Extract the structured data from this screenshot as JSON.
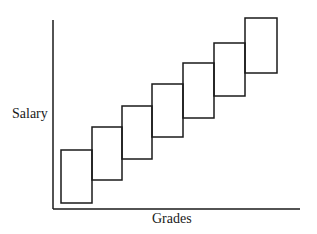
{
  "diagram": {
    "ylabel": "Salary",
    "xlabel": "Grades",
    "line_color": "#1a1a1a",
    "boxes": [
      {
        "grade": 1,
        "x": 61,
        "w": 31,
        "top": 150,
        "bottom": 203
      },
      {
        "grade": 2,
        "x": 92,
        "w": 30,
        "top": 127,
        "bottom": 180
      },
      {
        "grade": 3,
        "x": 122,
        "w": 30,
        "top": 106,
        "bottom": 159
      },
      {
        "grade": 4,
        "x": 152,
        "w": 31,
        "top": 84,
        "bottom": 137
      },
      {
        "grade": 5,
        "x": 183,
        "w": 31,
        "top": 63,
        "bottom": 118
      },
      {
        "grade": 6,
        "x": 214,
        "w": 31,
        "top": 43,
        "bottom": 96
      },
      {
        "grade": 7,
        "x": 245,
        "w": 32,
        "top": 18,
        "bottom": 73
      }
    ]
  }
}
